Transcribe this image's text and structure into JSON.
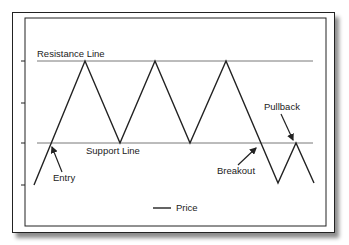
{
  "diagram": {
    "labels": {
      "resistance": "Resistance Line",
      "support": "Support Line",
      "entry": "Entry",
      "breakout": "Breakout",
      "pullback": "Pullback"
    },
    "legend": {
      "price": "Price"
    },
    "levels": {
      "resistance_y": 61,
      "support_y": 143
    },
    "price_path": [
      [
        34,
        185
      ],
      [
        85,
        61
      ],
      [
        120,
        143
      ],
      [
        155,
        61
      ],
      [
        190,
        143
      ],
      [
        226,
        61
      ],
      [
        278,
        183
      ],
      [
        296,
        143
      ],
      [
        314,
        183
      ]
    ],
    "colors": {
      "line": "#222222",
      "level_line": "#555555",
      "background": "#ffffff"
    }
  }
}
